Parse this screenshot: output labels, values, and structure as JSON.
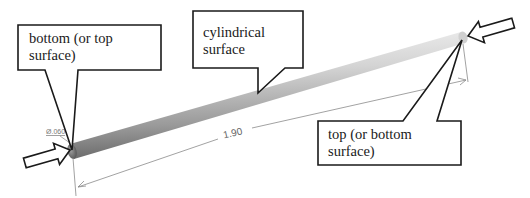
{
  "callouts": {
    "left": {
      "line1": "bottom (or top",
      "line2": "surface)"
    },
    "middle": {
      "line1": "cylindrical",
      "line2": "surface"
    },
    "right": {
      "line1": "top (or bottom",
      "line2": "surface)"
    }
  },
  "dimensions": {
    "length": "1.90",
    "diameter": "Ø.060"
  },
  "colors": {
    "outline": "#1a1a1a",
    "dimension_line": "#8a8a8a",
    "rod_light": "#e8e8e8",
    "rod_dark": "#6e6e6e"
  }
}
